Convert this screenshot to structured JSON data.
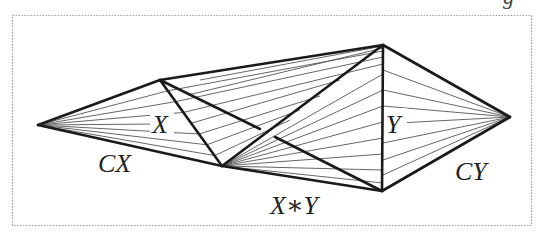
{
  "figure": {
    "labels": {
      "x": "X",
      "y": "Y",
      "cone_x": "CX",
      "cone_y": "CY",
      "join": "X∗Y",
      "cut_text_top_right": "g"
    },
    "frame": {
      "style": "dotted",
      "color": "#9a9a9a"
    },
    "colors": {
      "thick": "#1a1a1a",
      "thin": "#555555"
    },
    "vertices": {
      "cone_x_apex": [
        38,
        125
      ],
      "x_top": [
        160,
        80
      ],
      "x_bottom": [
        222,
        166
      ],
      "y_top": [
        383,
        45
      ],
      "y_bottom": [
        382,
        191
      ],
      "cone_y_apex": [
        510,
        117
      ]
    }
  }
}
